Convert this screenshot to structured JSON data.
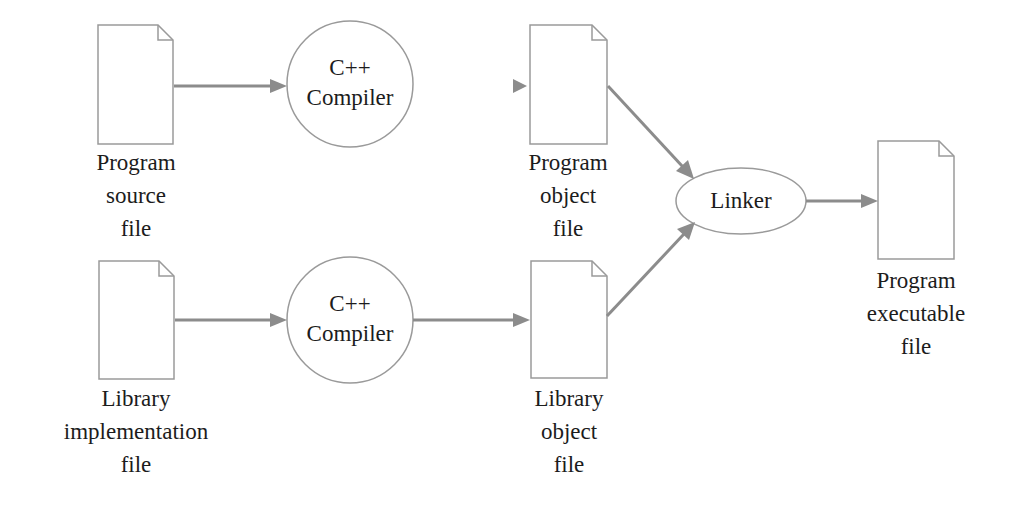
{
  "diagram": {
    "colors": {
      "stroke": "#9a9a9a",
      "arrow": "#8c8c8c",
      "text": "#1c1c1c",
      "background": "#ffffff"
    },
    "nodes": {
      "program_source_file": {
        "type": "document",
        "lines": [
          "Program",
          "source",
          "file"
        ]
      },
      "compiler_top": {
        "type": "circle",
        "lines": [
          "C++",
          "Compiler"
        ]
      },
      "program_object_file": {
        "type": "document",
        "lines": [
          "Program",
          "object",
          "file"
        ]
      },
      "library_implementation_file": {
        "type": "document",
        "lines": [
          "Library",
          "implementation",
          "file"
        ]
      },
      "compiler_bottom": {
        "type": "circle",
        "lines": [
          "C++",
          "Compiler"
        ]
      },
      "library_object_file": {
        "type": "document",
        "lines": [
          "Library",
          "object",
          "file"
        ]
      },
      "linker": {
        "type": "ellipse",
        "lines": [
          "Linker"
        ]
      },
      "program_executable_file": {
        "type": "document",
        "lines": [
          "Program",
          "executable",
          "file"
        ]
      }
    },
    "edges": [
      {
        "from": "program_source_file",
        "to": "compiler_top"
      },
      {
        "from": "compiler_top",
        "to": "program_object_file"
      },
      {
        "from": "library_implementation_file",
        "to": "compiler_bottom"
      },
      {
        "from": "compiler_bottom",
        "to": "library_object_file"
      },
      {
        "from": "program_object_file",
        "to": "linker"
      },
      {
        "from": "library_object_file",
        "to": "linker"
      },
      {
        "from": "linker",
        "to": "program_executable_file"
      }
    ]
  }
}
